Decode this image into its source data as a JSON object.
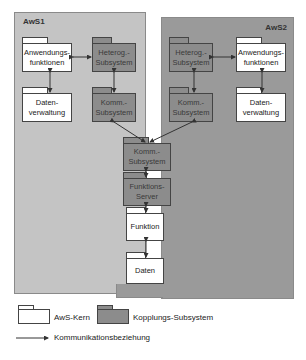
{
  "containers": {
    "aws1": {
      "title": "AwS1",
      "color": "#c4c4c4"
    },
    "aws2": {
      "title": "AwS2",
      "color": "#9a9a9a"
    }
  },
  "nodes": {
    "aws1_anwendung": "Anwendungs-\nfunktionen",
    "aws1_heterog": "Heterog.-\nSubsystem",
    "aws1_daten": "Daten-\nverwaltung",
    "aws1_komm": "Komm.-\nSubsystem",
    "aws2_heterog": "Heterog.-\nSubsystem",
    "aws2_anwendung": "Anwendungs-\nfunktionen",
    "aws2_komm": "Komm.-\nSubsystem",
    "aws2_daten": "Daten-\nverwaltung",
    "central_komm": "Komm.-\nSubsystem",
    "funktions_server": "Funktions-\nServer",
    "funktion": "Funktion",
    "daten": "Daten"
  },
  "legend": {
    "aws_kern": "AwS-Kern",
    "kopplungs_subsystem": "Kopplungs-Subsystem",
    "kommunikation": "Kommunikationsbeziehung"
  },
  "colors": {
    "white_box": "#ffffff",
    "dark_box": "#8c8c8c",
    "arrow": "#333333"
  }
}
